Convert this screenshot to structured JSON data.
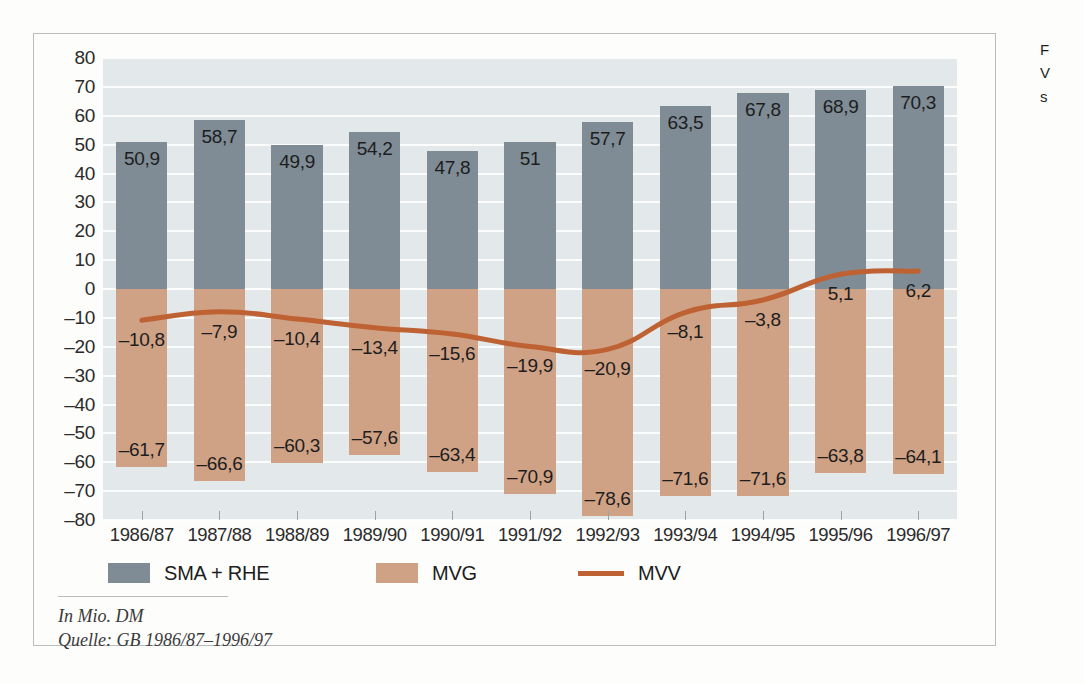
{
  "chart_data": {
    "type": "bar",
    "title": "",
    "xlabel": "",
    "ylabel": "",
    "ylim": [
      -80,
      80
    ],
    "ytick_step": 10,
    "grid": true,
    "legend_position": "bottom-left",
    "categories": [
      "1986/87",
      "1987/88",
      "1988/89",
      "1989/90",
      "1990/91",
      "1991/92",
      "1992/93",
      "1993/94",
      "1994/95",
      "1995/96",
      "1996/97"
    ],
    "ytick_labels": [
      "80",
      "70",
      "60",
      "50",
      "40",
      "30",
      "20",
      "10",
      "0",
      "–10",
      "–20",
      "–30",
      "–40",
      "–50",
      "–60",
      "–70",
      "–80"
    ],
    "ytick_values": [
      80,
      70,
      60,
      50,
      40,
      30,
      20,
      10,
      0,
      -10,
      -20,
      -30,
      -40,
      -50,
      -60,
      -70,
      -80
    ],
    "series": [
      {
        "name": "SMA + RHE",
        "type": "bar",
        "color": "#7f8c95",
        "values": [
          50.9,
          58.7,
          49.9,
          54.2,
          47.8,
          51,
          57.7,
          63.5,
          67.8,
          68.9,
          70.3
        ],
        "labels": [
          "50,9",
          "58,7",
          "49,9",
          "54,2",
          "47,8",
          "51",
          "57,7",
          "63,5",
          "67,8",
          "68,9",
          "70,3"
        ]
      },
      {
        "name": "MVG",
        "type": "bar",
        "color": "#cfa285",
        "values": [
          -61.7,
          -66.6,
          -60.3,
          -57.6,
          -63.4,
          -70.9,
          -78.6,
          -71.6,
          -71.6,
          -63.8,
          -64.1
        ],
        "labels": [
          "–61,7",
          "–66,6",
          "–60,3",
          "–57,6",
          "–63,4",
          "–70,9",
          "–78,6",
          "–71,6",
          "–71,6",
          "–63,8",
          "–64,1"
        ]
      },
      {
        "name": "MVV",
        "type": "line",
        "color": "#bf6233",
        "values": [
          -10.8,
          -7.9,
          -10.4,
          -13.4,
          -15.6,
          -19.9,
          -20.9,
          -8.1,
          -3.8,
          5.1,
          6.2
        ],
        "labels": [
          "–10,8",
          "–7,9",
          "–10,4",
          "–13,4",
          "–15,6",
          "–19,9",
          "–20,9",
          "–8,1",
          "–3,8",
          "5,1",
          "6,2"
        ]
      }
    ]
  },
  "legend": {
    "items": [
      {
        "label": "SMA + RHE",
        "marker": "swatch",
        "color": "#7f8c95"
      },
      {
        "label": "MVG",
        "marker": "swatch",
        "color": "#cfa285"
      },
      {
        "label": "MVV",
        "marker": "line",
        "color": "#bf6233"
      }
    ]
  },
  "footnote": {
    "unit_line": "In Mio. DM",
    "source_line": "Quelle: GB 1986/87–1996/97"
  },
  "side_caption": {
    "line1": "F",
    "line2": "V",
    "line3": "s"
  },
  "colors": {
    "plot_background": "#e3e9eb",
    "gridline": "#ffffff",
    "frame_border": "#b9bdbe",
    "page_background": "#fdfdfc",
    "bar_positive": "#7f8c95",
    "bar_negative": "#cfa285",
    "line": "#bf6233",
    "text": "#1d1d1d"
  }
}
